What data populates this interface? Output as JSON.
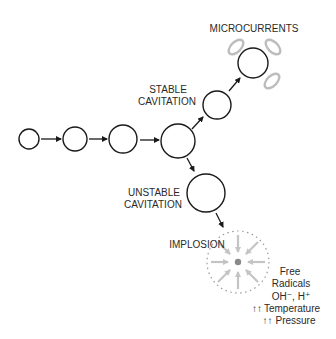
{
  "diagram": {
    "labels": {
      "microcurrents": "MICROCURRENTS",
      "stable_line1": "STABLE",
      "stable_line2": "CAVITATION",
      "unstable_line1": "UNSTABLE",
      "unstable_line2": "CAVITATION",
      "implosion": "IMPLOSION",
      "effects": {
        "line1": "Free",
        "line2": "Radicals",
        "line3": "OH⁻, H⁺",
        "temperature_arrows": "↑↑",
        "temperature": "Temperature",
        "pressure_arrows": "↑↑",
        "pressure": "Pressure"
      }
    },
    "nodes": [
      {
        "id": "bubble-1",
        "cx": 29,
        "cy": 139,
        "r": 10
      },
      {
        "id": "bubble-2",
        "cx": 75,
        "cy": 139,
        "r": 12
      },
      {
        "id": "bubble-3",
        "cx": 123,
        "cy": 139,
        "r": 14
      },
      {
        "id": "bubble-4",
        "cx": 178,
        "cy": 141,
        "r": 17
      },
      {
        "id": "stable-bubble",
        "cx": 217,
        "cy": 105,
        "r": 14
      },
      {
        "id": "microcurrent-bubble",
        "cx": 253,
        "cy": 63,
        "r": 15
      },
      {
        "id": "unstable-bubble",
        "cx": 206,
        "cy": 193,
        "r": 19
      },
      {
        "id": "implosion-zone",
        "cx": 238,
        "cy": 262,
        "r": 31
      }
    ],
    "colors": {
      "stroke": "#1a1a1a",
      "text": "#2a2a2a",
      "gray_ring": "#bdbdbd",
      "implosion_arrows": "#c4c4c4",
      "implosion_dashed": "#9a9a9a",
      "core": "#8a8a8a"
    }
  }
}
